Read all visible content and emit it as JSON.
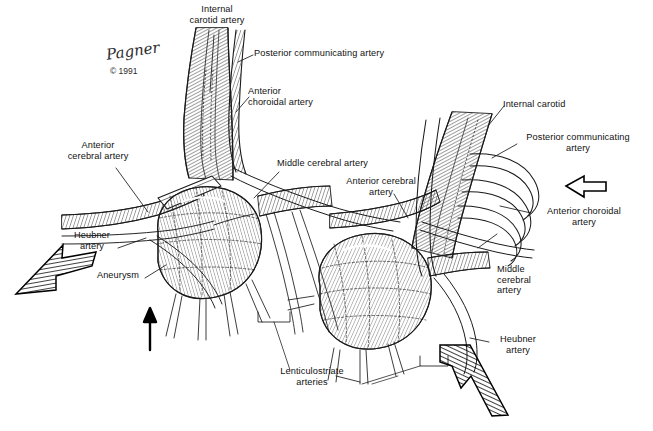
{
  "figure": {
    "background_color": "#ffffff",
    "ink_color": "#1a1a1a",
    "credit": {
      "signature": "Pagner",
      "copyright": "© 1991"
    }
  },
  "labels": {
    "internal_carotid_artery": "Internal\ncarotid artery",
    "posterior_communicating_artery_left": "Posterior communicating artery",
    "anterior_choroidal_artery_left": "Anterior\nchoroidal artery",
    "anterior_cerebral_artery_left": "Anterior\ncerebral artery",
    "middle_cerebral_artery_left": "Middle cerebral artery",
    "heubner_artery_left": "Heubner\nartery",
    "aneurysm": "Aneurysm",
    "lenticulostriate_arteries": "Lenticulostriate\narteries",
    "internal_carotid_right": "Internal carotid",
    "posterior_communicating_artery_right": "Posterior communicating\nartery",
    "anterior_choroidal_artery_right": "Anterior choroidal\nartery",
    "anterior_cerebral_artery_right": "Anterior cerebral\nartery",
    "middle_cerebral_artery_right": "Middle\ncerebral\nartery",
    "heubner_artery_right": "Heubner\nartery"
  },
  "markers": {
    "hatched_arrow_left": "hatched arrow pointing up-right toward aneurysm",
    "hatched_arrow_right": "hatched arrow pointing up-left toward aneurysm",
    "solid_arrow_up": "solid black arrow pointing up",
    "hollow_arrow_left": "hollow outline arrow pointing left"
  }
}
